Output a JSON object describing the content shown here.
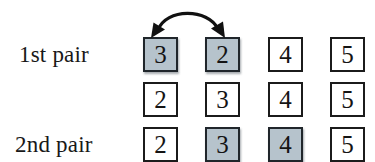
{
  "diagram": {
    "background_color": "#ffffff",
    "shaded_cell_color": "#b6c3cc",
    "border_color": "#1b1b1b",
    "text_color": "#141414",
    "labels": {
      "first_pair": "1st pair",
      "second_pair": "2nd pair"
    },
    "rows": [
      {
        "label": "1st pair",
        "cells": [
          {
            "value": "3",
            "shaded": true
          },
          {
            "value": "2",
            "shaded": true
          },
          {
            "value": "4",
            "shaded": false
          },
          {
            "value": "5",
            "shaded": false
          }
        ]
      },
      {
        "label": "",
        "cells": [
          {
            "value": "2",
            "shaded": false
          },
          {
            "value": "3",
            "shaded": false
          },
          {
            "value": "4",
            "shaded": false
          },
          {
            "value": "5",
            "shaded": false
          }
        ]
      },
      {
        "label": "2nd pair",
        "cells": [
          {
            "value": "2",
            "shaded": false
          },
          {
            "value": "3",
            "shaded": true
          },
          {
            "value": "4",
            "shaded": true
          },
          {
            "value": "5",
            "shaded": false
          }
        ]
      }
    ],
    "annotation": {
      "name": "swap-arrow",
      "type": "double-headed-curved-arrow",
      "from_cell": "row-0-col-0",
      "to_cell": "row-0-col-1"
    }
  }
}
